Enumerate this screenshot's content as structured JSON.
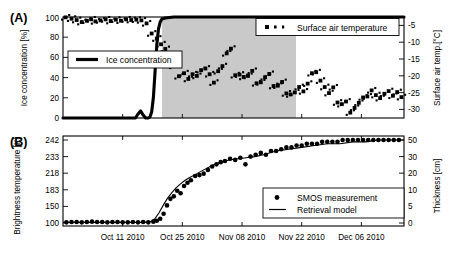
{
  "figure": {
    "panels": [
      {
        "letter": "(A)",
        "left_axis_title": "Ice concentration [%]",
        "right_axis_title": "Surface air temp.[°C]",
        "left_ticks": [
          "0",
          "20",
          "40",
          "60",
          "80",
          "100"
        ],
        "right_ticks": [
          "-5",
          "-10",
          "-15",
          "-20",
          "-25",
          "-30"
        ],
        "legend": [
          {
            "label": "Surface air temperature",
            "marker": "dotted-square-marker"
          },
          {
            "label": "Ice concentration",
            "marker": "thick-line-marker"
          }
        ]
      },
      {
        "letter": "(B)",
        "left_axis_title": "Brightness temperature [K]",
        "right_axis_title": "Thickness [cm]",
        "left_ticks": [
          "100",
          "150",
          "183",
          "218",
          "233",
          "242"
        ],
        "right_ticks": [
          "0",
          "5",
          "10",
          "20",
          "30",
          "50"
        ],
        "legend": [
          {
            "label": "SMOS measurement",
            "marker": "dot-marker"
          },
          {
            "label": "Retrieval model",
            "marker": "line-marker"
          }
        ]
      }
    ],
    "x_axis": {
      "tick_labels": [
        "Oct 11 2010",
        "Oct 25 2010",
        "Nov 08 2010",
        "Nov 22 2010",
        "Dec 06 2010"
      ],
      "tick_positions": [
        14,
        28,
        42,
        56,
        70
      ],
      "range": [
        0,
        80
      ]
    }
  },
  "chart_data": [
    {
      "type": "line",
      "title": "Ice concentration and surface air temperature",
      "xlabel": "",
      "ylabel": "Ice concentration [%]",
      "y2label": "Surface air temp.[°C]",
      "ylim": [
        0,
        100
      ],
      "y2lim": [
        -32.5,
        -2.5
      ],
      "xlim": [
        0,
        80
      ],
      "grid": false,
      "legend_position": "top-right and mid-left",
      "shaded_region": {
        "x_start": 22.5,
        "x_end": 43.5,
        "color": "#c9c9c9",
        "label": "freeze-up period"
      },
      "series": [
        {
          "name": "Ice concentration",
          "type": "line",
          "x": [
            0,
            2,
            4,
            6,
            8,
            10,
            12,
            14,
            16,
            17,
            17.6,
            18.2,
            18.8,
            19.4,
            20,
            20.4,
            20.8,
            21.2,
            21.6,
            22,
            22.4,
            22.8,
            23.2,
            24,
            26,
            30,
            36,
            42,
            48,
            54,
            60,
            66,
            72,
            78,
            80
          ],
          "y": [
            0,
            0,
            0,
            0,
            0,
            0,
            0,
            0,
            0,
            0,
            4,
            7,
            3,
            0,
            0,
            1,
            6,
            20,
            46,
            72,
            88,
            95,
            98,
            99,
            100,
            100,
            100,
            100,
            100,
            100,
            100,
            100,
            100,
            100,
            100
          ]
        },
        {
          "name": "Surface air temperature",
          "type": "scatter",
          "x": [
            0.6,
            2.0,
            3.2,
            4.4,
            5.6,
            6.6,
            7.6,
            8.8,
            10.0,
            11.2,
            12.4,
            13.6,
            14.8,
            16.0,
            17.2,
            18.4,
            19.6,
            20.8,
            22.0,
            23.0,
            24.0,
            25.0,
            26.0,
            27.2,
            28.4,
            29.4,
            30.4,
            31.4,
            32.4,
            33.4,
            34.4,
            35.4,
            36.4,
            37.4,
            38.4,
            39.4,
            40.4,
            41.4,
            42.4,
            43.4,
            44.4,
            45.4,
            46.4,
            47.4,
            48.4,
            49.4,
            50.4,
            51.4,
            52.4,
            53.4,
            54.4,
            55.4,
            56.4,
            57.4,
            58.4,
            59.4,
            60.4,
            61.4,
            62.4,
            63.4,
            64.4,
            65.4,
            66.4,
            67.4,
            68.4,
            69.4,
            70.4,
            71.4,
            72.4,
            73.4,
            74.4,
            75.4,
            76.4,
            77.4,
            78.4,
            79.4
          ],
          "y": [
            -2.6,
            -3.0,
            -3.4,
            -4.0,
            -3.6,
            -3.2,
            -3.8,
            -3.5,
            -3.2,
            -3.7,
            -3.3,
            -3.6,
            -3.2,
            -3.4,
            -3.3,
            -3.5,
            -4.4,
            -7.4,
            -8.9,
            -10.6,
            -12.0,
            -14.4,
            -17.0,
            -20.1,
            -19.2,
            -20.9,
            -19.5,
            -20.0,
            -18.3,
            -17.8,
            -19.5,
            -22.0,
            -18.6,
            -17.1,
            -13.3,
            -11.9,
            -19.8,
            -19.6,
            -20.3,
            -20.0,
            -18.5,
            -22.2,
            -21.9,
            -20.4,
            -19.4,
            -23.0,
            -22.9,
            -21.8,
            -25.2,
            -25.5,
            -24.9,
            -23.3,
            -24.6,
            -22.3,
            -19.2,
            -18.9,
            -21.4,
            -23.3,
            -25.1,
            -23.4,
            -27.9,
            -28.4,
            -27.6,
            -30.9,
            -29.5,
            -28.0,
            -26.4,
            -26.1,
            -24.3,
            -25.7,
            -26.6,
            -25.3,
            -24.5,
            -25.9,
            -24.8,
            -26.3
          ]
        }
      ]
    },
    {
      "type": "line",
      "title": "SMOS brightness temperature and retrieved ice thickness",
      "xlabel": "",
      "ylabel": "Brightness temperature [K]",
      "y2label": "Thickness [cm]",
      "ylim": [
        95,
        248
      ],
      "y2lim": [
        -1.5,
        52
      ],
      "xlim": [
        0,
        80
      ],
      "grid": false,
      "legend_position": "lower-right",
      "ytick_values": [
        100,
        150,
        183,
        218,
        233,
        242
      ],
      "y2tick_values": [
        0,
        5,
        10,
        20,
        30,
        50
      ],
      "series": [
        {
          "name": "SMOS measurement",
          "type": "scatter",
          "x": [
            0.8,
            2.0,
            3.2,
            4.4,
            5.6,
            6.8,
            8.0,
            9.2,
            10.4,
            11.6,
            12.8,
            14.0,
            15.2,
            16.4,
            17.6,
            18.8,
            20.0,
            21.2,
            22.0,
            22.8,
            23.6,
            24.4,
            25.2,
            26.0,
            26.8,
            27.6,
            28.4,
            29.2,
            30.0,
            31.0,
            32.0,
            33.0,
            34.0,
            35.0,
            36.0,
            37.0,
            38.0,
            39.2,
            40.4,
            41.6,
            42.8,
            44.0,
            45.2,
            46.4,
            47.6,
            48.8,
            50.0,
            51.2,
            52.4,
            53.6,
            54.8,
            56.0,
            57.2,
            58.4,
            59.6,
            60.8,
            62.0,
            63.2,
            64.4,
            65.6,
            66.8,
            68.0,
            69.2,
            70.4,
            71.6,
            72.8,
            74.0,
            75.2,
            76.4,
            77.6,
            78.8
          ],
          "y": [
            102,
            103,
            103,
            102,
            103,
            104,
            103,
            103,
            102,
            103,
            103,
            102,
            102,
            103,
            102,
            103,
            102,
            104,
            107,
            113,
            128,
            152,
            165,
            170,
            181,
            176,
            191,
            198,
            203,
            212,
            214,
            217,
            221,
            224,
            226,
            228,
            229,
            231,
            230,
            232,
            226,
            233,
            234,
            235,
            234,
            236,
            236,
            237,
            238,
            238,
            239,
            239,
            240,
            240,
            240,
            241,
            241,
            241,
            241,
            242,
            242,
            242,
            242,
            242,
            242,
            243,
            243,
            243,
            243,
            243,
            243
          ]
        },
        {
          "name": "Retrieval model",
          "type": "line",
          "x": [
            0,
            4,
            8,
            12,
            16,
            19,
            20.5,
            21.5,
            22.5,
            23.5,
            24.5,
            25.5,
            26.5,
            27.5,
            28.5,
            29.5,
            31,
            33,
            35,
            37,
            39,
            41,
            43,
            45,
            47,
            50,
            53,
            56,
            59,
            62,
            65,
            68,
            71,
            74,
            77,
            80
          ],
          "y": [
            102,
            102,
            102,
            102,
            102,
            102,
            104,
            112,
            130,
            152,
            166,
            177,
            187,
            195,
            202,
            208,
            215,
            221,
            225,
            228,
            230,
            231,
            232,
            233,
            234,
            236,
            237,
            238,
            239,
            240,
            240,
            241,
            241,
            242,
            242,
            242
          ]
        }
      ]
    }
  ]
}
